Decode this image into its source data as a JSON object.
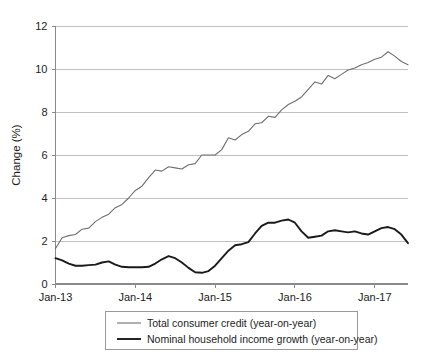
{
  "chart_data": {
    "type": "line",
    "title": "",
    "xlabel": "",
    "ylabel": "Change (%)",
    "ylim": [
      0,
      12
    ],
    "yticks": [
      0,
      2,
      4,
      6,
      8,
      10,
      12
    ],
    "ytick_labels": [
      "0",
      "2",
      "4",
      "6",
      "8",
      "10",
      "12"
    ],
    "xlim": [
      "Jan-13",
      "Jul-17"
    ],
    "xticks": [
      "Jan-13",
      "Jan-14",
      "Jan-15",
      "Jan-16",
      "Jan-17"
    ],
    "xtick_labels": [
      "Jan-13",
      "Jan-14",
      "Jan-15",
      "Jan-16",
      "Jan-17"
    ],
    "grid": true,
    "legend_position": "bottom",
    "x": [
      "Jan-13",
      "Feb-13",
      "Mar-13",
      "Apr-13",
      "May-13",
      "Jun-13",
      "Jul-13",
      "Aug-13",
      "Sep-13",
      "Oct-13",
      "Nov-13",
      "Dec-13",
      "Jan-14",
      "Feb-14",
      "Mar-14",
      "Apr-14",
      "May-14",
      "Jun-14",
      "Jul-14",
      "Aug-14",
      "Sep-14",
      "Oct-14",
      "Nov-14",
      "Dec-14",
      "Jan-15",
      "Feb-15",
      "Mar-15",
      "Apr-15",
      "May-15",
      "Jun-15",
      "Jul-15",
      "Aug-15",
      "Sep-15",
      "Oct-15",
      "Nov-15",
      "Dec-15",
      "Jan-16",
      "Feb-16",
      "Mar-16",
      "Apr-16",
      "May-16",
      "Jun-16",
      "Jul-16",
      "Aug-16",
      "Sep-16",
      "Oct-16",
      "Nov-16",
      "Dec-16",
      "Jan-17",
      "Feb-17",
      "Mar-17",
      "Apr-17",
      "May-17",
      "Jun-17"
    ],
    "series": [
      {
        "name": "Total consumer credit (year-on-year)",
        "color": "#6e6e6e",
        "width": 1.1,
        "values": [
          1.65,
          2.15,
          2.25,
          2.3,
          2.55,
          2.6,
          2.9,
          3.1,
          3.25,
          3.55,
          3.7,
          4.0,
          4.35,
          4.55,
          4.95,
          5.3,
          5.25,
          5.45,
          5.4,
          5.35,
          5.55,
          5.6,
          6.0,
          6.0,
          6.0,
          6.25,
          6.8,
          6.7,
          6.95,
          7.1,
          7.45,
          7.5,
          7.8,
          7.75,
          8.1,
          8.35,
          8.5,
          8.7,
          9.05,
          9.4,
          9.3,
          9.7,
          9.55,
          9.75,
          9.95,
          10.05,
          10.2,
          10.3,
          10.45,
          10.55,
          10.8,
          10.6,
          10.35,
          10.2
        ]
      },
      {
        "name": "Nominal household income growth (year-on-year)",
        "color": "#1a1a1a",
        "width": 1.9,
        "values": [
          1.2,
          1.1,
          0.95,
          0.85,
          0.85,
          0.88,
          0.9,
          1.0,
          1.05,
          0.9,
          0.8,
          0.78,
          0.78,
          0.78,
          0.8,
          0.95,
          1.15,
          1.3,
          1.2,
          1.0,
          0.75,
          0.55,
          0.52,
          0.6,
          0.85,
          1.2,
          1.55,
          1.8,
          1.85,
          1.95,
          2.35,
          2.7,
          2.85,
          2.85,
          2.95,
          3.0,
          2.85,
          2.45,
          2.15,
          2.2,
          2.25,
          2.45,
          2.5,
          2.45,
          2.4,
          2.45,
          2.35,
          2.3,
          2.45,
          2.6,
          2.65,
          2.55,
          2.3,
          1.9
        ]
      }
    ],
    "legend": [
      {
        "label": "Total consumer credit (year-on-year)",
        "color": "#6e6e6e",
        "width": 1.1
      },
      {
        "label": "Nominal household income growth (year-on-year)",
        "color": "#1a1a1a",
        "width": 1.9
      }
    ]
  }
}
